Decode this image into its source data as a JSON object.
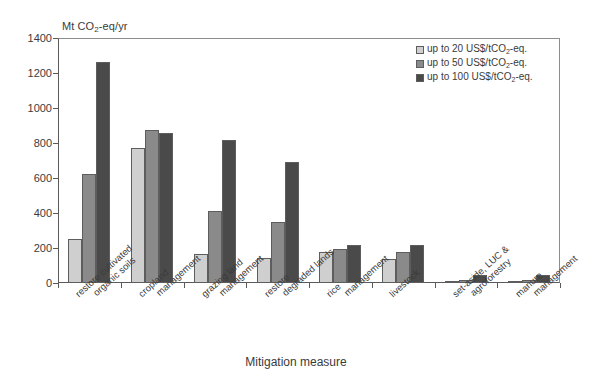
{
  "chart_data": {
    "type": "bar",
    "title": "",
    "ylabel": "Mt CO2-eq/yr",
    "ylabel_parts": {
      "pre": "Mt CO",
      "sub": "2",
      "post": "-eq/yr"
    },
    "xlabel": "Mitigation measure",
    "ylim": [
      0,
      1400
    ],
    "yticks": [
      0,
      200,
      400,
      600,
      800,
      1000,
      1200,
      1400
    ],
    "grid": false,
    "legend_position": "top-right",
    "categories": [
      "restore cultivated organic soils",
      "cropland management",
      "grazing land management",
      "restore degraded lands",
      "rice management",
      "livestock",
      "set-aside, LUC & agroforestry",
      "manure management"
    ],
    "category_lines": [
      [
        "restore cultivated",
        "organic soils"
      ],
      [
        "cropland",
        "management"
      ],
      [
        "grazing land",
        "management"
      ],
      [
        "restore",
        "degraded lands"
      ],
      [
        "rice",
        "management"
      ],
      [
        "livestock",
        ""
      ],
      [
        "set-aside, LUC &",
        "agroforestry"
      ],
      [
        "manure",
        "management"
      ]
    ],
    "series": [
      {
        "name": "up to 20 US$/tCO2-eq.",
        "name_parts": {
          "pre": "up to 20 US$/tCO",
          "sub": "2",
          "post": "-eq."
        },
        "color": "#cfcfcf",
        "values": [
          250,
          770,
          165,
          145,
          175,
          140,
          5,
          5
        ]
      },
      {
        "name": "up to 50 US$/tCO2-eq.",
        "name_parts": {
          "pre": "up to 50 US$/tCO",
          "sub": "2",
          "post": "-eq."
        },
        "color": "#8a8a8a",
        "values": [
          625,
          875,
          410,
          350,
          195,
          175,
          20,
          20
        ]
      },
      {
        "name": "up to 100 US$/tCO2-eq.",
        "name_parts": {
          "pre": "up to 100 US$/tCO",
          "sub": "2",
          "post": "-eq."
        },
        "color": "#4a4a4a",
        "values": [
          1265,
          855,
          815,
          690,
          220,
          220,
          45,
          45
        ]
      }
    ]
  }
}
